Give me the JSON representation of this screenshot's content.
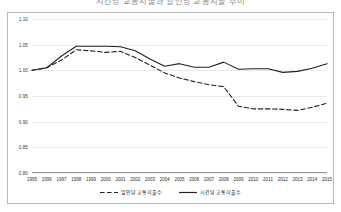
{
  "title": "시간당 교통지출과 일인당 교통지출 추이",
  "chart_data": {
    "type": "line",
    "title": "시간당 교통지출과 일인당 교통지출 추이",
    "xlabel": "",
    "ylabel": "",
    "grid": true,
    "legend_position": "bottom",
    "ylim": [
      0.8,
      1.1
    ],
    "yticks": [
      "1.10",
      "1.05",
      "1.00",
      "0.95",
      "0.90",
      "0.85",
      "0.80"
    ],
    "ytick_values": [
      1.1,
      1.05,
      1.0,
      0.95,
      0.9,
      0.85,
      0.8
    ],
    "categories": [
      "1995",
      "1996",
      "1997",
      "1998",
      "1999",
      "2000",
      "2001",
      "2002",
      "2003",
      "2004",
      "2005",
      "2006",
      "2007",
      "2008",
      "2009",
      "2010",
      "2011",
      "2012",
      "2013",
      "2014",
      "2015"
    ],
    "series": [
      {
        "name": "일인당 교통지출수",
        "style": "dashed",
        "color": "#222222",
        "values": [
          1.0,
          1.005,
          1.02,
          1.04,
          1.038,
          1.035,
          1.037,
          1.025,
          1.01,
          0.995,
          0.985,
          0.978,
          0.972,
          0.968,
          0.93,
          0.925,
          0.925,
          0.924,
          0.922,
          0.928,
          0.936
        ]
      },
      {
        "name": "시간당 교통지출수",
        "style": "solid",
        "color": "#222222",
        "values": [
          1.0,
          1.005,
          1.028,
          1.047,
          1.047,
          1.047,
          1.046,
          1.038,
          1.022,
          1.008,
          1.013,
          1.006,
          1.006,
          1.016,
          1.002,
          1.003,
          1.003,
          0.996,
          0.998,
          1.004,
          1.013
        ]
      }
    ]
  },
  "legend": [
    {
      "label": "일인당 교통지출수",
      "style": "dashed"
    },
    {
      "label": "시간당 교통지출수",
      "style": "solid"
    }
  ]
}
